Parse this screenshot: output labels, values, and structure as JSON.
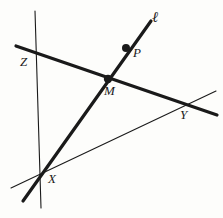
{
  "figure": {
    "background_color": "#fdfdfb",
    "ink_color": "#1a1a1a",
    "width": 223,
    "height": 218,
    "labels": {
      "line_l": "ℓ",
      "point_p": "P",
      "point_z": "Z",
      "point_m": "M",
      "point_y": "Y",
      "point_x": "X"
    },
    "label_positions": {
      "line_l": {
        "x": 152,
        "y": 10
      },
      "point_p": {
        "x": 133,
        "y": 46
      },
      "point_z": {
        "x": 20,
        "y": 55
      },
      "point_m": {
        "x": 104,
        "y": 84
      },
      "point_y": {
        "x": 180,
        "y": 108
      },
      "point_x": {
        "x": 48,
        "y": 172
      }
    },
    "lines": [
      {
        "name": "thick-line-ZY",
        "description": "Thick transversal through Z, M and Y",
        "x1": 16,
        "y1": 46,
        "x2": 217,
        "y2": 115,
        "stroke_width": 3.2
      },
      {
        "name": "thick-line-l",
        "description": "Thick line l through P, M and X",
        "x1": 151,
        "y1": 21,
        "x2": 23,
        "y2": 201,
        "stroke_width": 3.2
      },
      {
        "name": "thin-vertical-line",
        "description": "Thin near-vertical line through Z and X",
        "x1": 35,
        "y1": 11,
        "x2": 41,
        "y2": 208,
        "stroke_width": 1.1
      },
      {
        "name": "thin-line-XY",
        "description": "Thin line from X rising to Y",
        "x1": 11,
        "y1": 188,
        "x2": 216,
        "y2": 91,
        "stroke_width": 1.1
      }
    ],
    "points": [
      {
        "name": "point-p-dot",
        "label": "P",
        "x": 126,
        "y": 48,
        "radius": 4.0
      },
      {
        "name": "point-m-dot",
        "label": "M",
        "x": 108,
        "y": 79,
        "radius": 4.2
      }
    ],
    "intersections": [
      {
        "name": "Z",
        "x": 37,
        "y": 53,
        "description": "thin vertical meets thick line ZY"
      },
      {
        "name": "M",
        "x": 108,
        "y": 79,
        "description": "line l meets thick line ZY"
      },
      {
        "name": "Y",
        "x": 188,
        "y": 104,
        "description": "thick line ZY meets thin line XY"
      },
      {
        "name": "X",
        "x": 42,
        "y": 173,
        "description": "line l, thin vertical and thin line XY meet"
      }
    ]
  }
}
